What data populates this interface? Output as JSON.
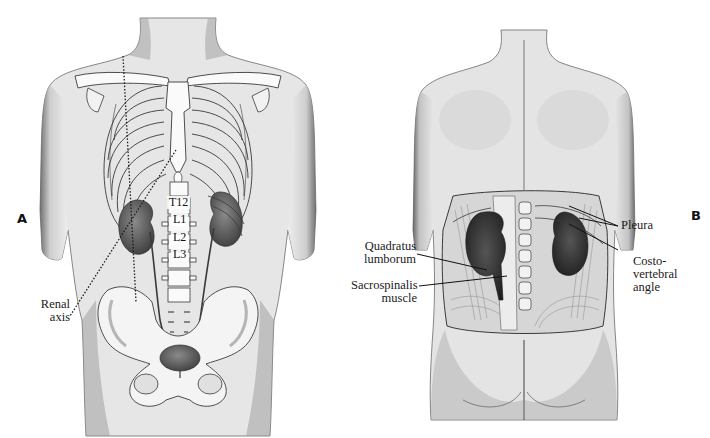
{
  "figure": {
    "panels": [
      {
        "id": "A",
        "letter": "A",
        "view": "anterior",
        "labels": {
          "renal_axis": {
            "line1": "Renal",
            "line2": "axis"
          }
        },
        "vertebrae": [
          "T12",
          "L1",
          "L2",
          "L3"
        ]
      },
      {
        "id": "B",
        "letter": "B",
        "view": "posterior",
        "labels": {
          "quadratus": {
            "line1": "Quadratus",
            "line2": "lumborum"
          },
          "sacrospinalis": {
            "line1": "Sacrospinalis",
            "line2": "muscle"
          },
          "pleura": {
            "line1": "Pleura"
          },
          "costovertebral": {
            "line1": "Costo-",
            "line2": "vertebral",
            "line3": "angle"
          }
        }
      }
    ],
    "colors": {
      "background": "#ffffff",
      "skin_shade": "#8a8a8a",
      "outline": "#3a3a3a",
      "organ_dark": "#2e2e2e",
      "bone": "#fafafa"
    }
  }
}
